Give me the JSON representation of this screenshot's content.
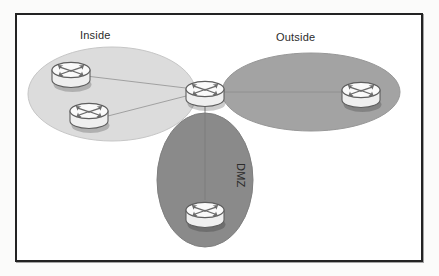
{
  "figure": {
    "background_color": "#fbfbfa",
    "frame_color": "#232323",
    "frame_fill": "#ffffff"
  },
  "zones": [
    {
      "id": "inside",
      "label": "Inside",
      "fill": "#dcdcdc",
      "stroke": "#c3c3c3",
      "shape": "ellipse",
      "cx": 112,
      "cy": 94,
      "rx": 84,
      "ry": 47,
      "rotation": 0
    },
    {
      "id": "outside",
      "label": "Outside",
      "fill": "#a3a3a3",
      "stroke": "#949494",
      "shape": "ellipse",
      "cx": 311,
      "cy": 92,
      "rx": 89,
      "ry": 39,
      "rotation": 0
    },
    {
      "id": "dmz",
      "label": "DMZ",
      "fill": "#8a8a8a",
      "stroke": "#7d7d7d",
      "shape": "ellipse",
      "cx": 205,
      "cy": 180,
      "rx": 48,
      "ry": 67,
      "rotation": 0
    }
  ],
  "devices": [
    {
      "id": "inside-router-top",
      "type": "router",
      "zone": "inside",
      "cx": 71,
      "cy": 72
    },
    {
      "id": "inside-router-bottom",
      "type": "router",
      "zone": "inside",
      "cx": 89,
      "cy": 113
    },
    {
      "id": "firewall-hub-router",
      "type": "router",
      "zone": "center",
      "cx": 205,
      "cy": 91
    },
    {
      "id": "outside-router",
      "type": "router",
      "zone": "outside",
      "cx": 361,
      "cy": 92
    },
    {
      "id": "dmz-router",
      "type": "router",
      "zone": "dmz",
      "cx": 205,
      "cy": 212
    }
  ],
  "links": [
    {
      "id": "link-inside-top",
      "from": "inside-router-top",
      "to": "firewall-hub-router",
      "x1": 86,
      "y1": 76,
      "x2": 194,
      "y2": 89,
      "color": "#9a9a9a"
    },
    {
      "id": "link-inside-bottom",
      "from": "inside-router-bottom",
      "to": "firewall-hub-router",
      "x1": 104,
      "y1": 117,
      "x2": 194,
      "y2": 94,
      "color": "#9a9a9a"
    },
    {
      "id": "link-outside",
      "from": "firewall-hub-router",
      "to": "outside-router",
      "x1": 218,
      "y1": 92,
      "x2": 348,
      "y2": 92,
      "color": "#8f8f8f"
    },
    {
      "id": "link-dmz",
      "from": "firewall-hub-router",
      "to": "dmz-router",
      "x1": 205,
      "y1": 104,
      "x2": 205,
      "y2": 200,
      "color": "#7a7a7a"
    }
  ],
  "icon": {
    "name": "router-icon",
    "body_fill": "#f2f2f2",
    "body_stroke": "#5e5e5e",
    "top_fill": "#fafafa",
    "arrow_fill": "#6d6d6d"
  }
}
